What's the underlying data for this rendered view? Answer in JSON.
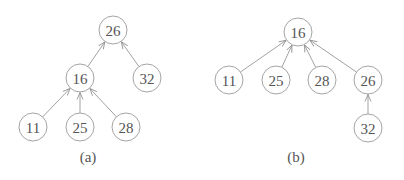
{
  "diagrams": [
    {
      "id": "a",
      "caption": "(a)",
      "caption_pos": [
        88,
        157
      ],
      "nodes": [
        {
          "id": "a26",
          "label": "26",
          "x": 113,
          "y": 30
        },
        {
          "id": "a16",
          "label": "16",
          "x": 80,
          "y": 78
        },
        {
          "id": "a32",
          "label": "32",
          "x": 147,
          "y": 78
        },
        {
          "id": "a11",
          "label": "11",
          "x": 33,
          "y": 127
        },
        {
          "id": "a25",
          "label": "25",
          "x": 80,
          "y": 127
        },
        {
          "id": "a28",
          "label": "28",
          "x": 126,
          "y": 127
        }
      ],
      "edges": [
        {
          "from": "a16",
          "to": "a26"
        },
        {
          "from": "a32",
          "to": "a26"
        },
        {
          "from": "a11",
          "to": "a16"
        },
        {
          "from": "a25",
          "to": "a16"
        },
        {
          "from": "a28",
          "to": "a16"
        }
      ]
    },
    {
      "id": "b",
      "caption": "(b)",
      "caption_pos": [
        296,
        157
      ],
      "nodes": [
        {
          "id": "b16",
          "label": "16",
          "x": 298,
          "y": 32
        },
        {
          "id": "b11",
          "label": "11",
          "x": 229,
          "y": 80
        },
        {
          "id": "b25",
          "label": "25",
          "x": 276,
          "y": 80
        },
        {
          "id": "b28",
          "label": "28",
          "x": 322,
          "y": 80
        },
        {
          "id": "b26",
          "label": "26",
          "x": 368,
          "y": 80
        },
        {
          "id": "b32",
          "label": "32",
          "x": 368,
          "y": 128
        }
      ],
      "edges": [
        {
          "from": "b11",
          "to": "b16"
        },
        {
          "from": "b25",
          "to": "b16"
        },
        {
          "from": "b28",
          "to": "b16"
        },
        {
          "from": "b26",
          "to": "b16"
        },
        {
          "from": "b32",
          "to": "b26"
        }
      ]
    }
  ],
  "style": {
    "node_radius": 14,
    "stroke_color": "#9a9a9a",
    "text_color": "#555555"
  }
}
